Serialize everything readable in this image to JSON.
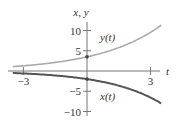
{
  "chart_data": {
    "type": "line",
    "title": "",
    "xlabel": "t",
    "ylabel": "x, y",
    "xlim": [
      -3.6,
      3.6
    ],
    "ylim": [
      -11,
      11
    ],
    "xticks": [
      {
        "value": -3,
        "label": "−3"
      },
      {
        "value": 3,
        "label": "3"
      }
    ],
    "yticks": [
      {
        "value": 10,
        "label": "10"
      },
      {
        "value": 5,
        "label": "5"
      },
      {
        "value": -5,
        "label": "−5"
      },
      {
        "value": -10,
        "label": "−10"
      }
    ],
    "grid": false,
    "series": [
      {
        "name": "y(t)",
        "label": "y(t)",
        "color": "#aaaaaa",
        "x": [
          -3.5,
          -3,
          -2,
          -1,
          0,
          1,
          2,
          3,
          3.5
        ],
        "values": [
          1.1,
          1.3,
          1.8,
          2.5,
          3.5,
          4.9,
          6.9,
          9.6,
          11.3
        ]
      },
      {
        "name": "x(t)",
        "label": "x(t)",
        "color": "#555555",
        "x": [
          -3.5,
          -3,
          -2,
          -1,
          0,
          1,
          2,
          3,
          3.5
        ],
        "values": [
          -0.5,
          -0.6,
          -0.9,
          -1.3,
          -2.0,
          -3.0,
          -4.5,
          -6.6,
          -8.0
        ]
      }
    ]
  }
}
